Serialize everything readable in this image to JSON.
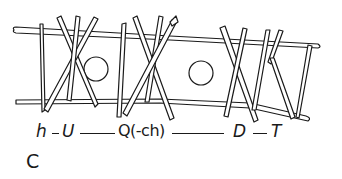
{
  "figure": {
    "panel_label": "C",
    "sequence_labels": {
      "h": "h",
      "sep1": "–",
      "U": "U",
      "Q": "Q(-ch)",
      "D": "D",
      "T": "T"
    },
    "colors": {
      "ink": "#1a1a1a",
      "background": "#ffffff"
    }
  }
}
